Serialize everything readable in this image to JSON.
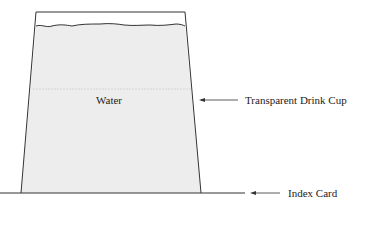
{
  "diagram": {
    "title": "",
    "labels": {
      "water": "Water",
      "cup": "Transparent Drink Cup",
      "index_card": "Index Card"
    },
    "colors": {
      "line": "#333333",
      "water_fill": "#ededed",
      "background": "#ffffff"
    }
  }
}
